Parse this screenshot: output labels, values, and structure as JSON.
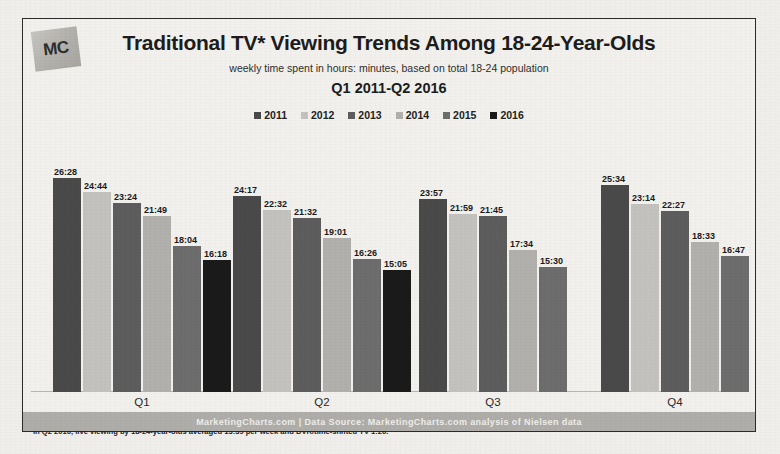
{
  "logo": {
    "text": "MC"
  },
  "header": {
    "title": "Traditional TV* Viewing Trends Among 18-24-Year-Olds",
    "subtitle": "weekly time spent in hours: minutes, based on total 18-24 population",
    "date_range": "Q1 2011-Q2 2016"
  },
  "footnotes": {
    "line1": "*Traditional TV refers to all live + DVR/time-shifted TV viewing during the quarter.",
    "line2": "In Q2 2016, live viewing by 18-24-year-olds averaged 13:39 per week and DVR/time-shifted TV 1:26."
  },
  "footer": {
    "text": "MarketingCharts.com | Data Source: MarketingCharts.com analysis of Nielsen data"
  },
  "chart_data": {
    "type": "bar",
    "title": "Traditional TV* Viewing Trends Among 18-24-Year-Olds",
    "subtitle": "weekly time spent in hours: minutes, based on total 18-24 population",
    "xlabel": "",
    "ylabel": "weekly time spent (hours:minutes)",
    "ylim": [
      0,
      28
    ],
    "grid": false,
    "legend_position": "top-center",
    "categories": [
      "Q1",
      "Q2",
      "Q3",
      "Q4"
    ],
    "series": [
      {
        "name": "2011",
        "color": "#4a4a4a",
        "labels": [
          "26:28",
          "24:17",
          "23:57",
          "25:34"
        ],
        "values": [
          26.47,
          24.28,
          23.95,
          25.57
        ]
      },
      {
        "name": "2012",
        "color": "#c5c4c0",
        "labels": [
          "24:44",
          "22:32",
          "21:59",
          "23:14"
        ],
        "values": [
          24.73,
          22.53,
          21.98,
          23.23
        ]
      },
      {
        "name": "2013",
        "color": "#5e5e5e",
        "labels": [
          "23:24",
          "21:32",
          "21:45",
          "22:27"
        ],
        "values": [
          23.4,
          21.53,
          21.75,
          22.45
        ]
      },
      {
        "name": "2014",
        "color": "#b3b2ae",
        "labels": [
          "21:49",
          "19:01",
          "17:34",
          "18:33"
        ],
        "values": [
          21.82,
          19.02,
          17.57,
          18.55
        ]
      },
      {
        "name": "2015",
        "color": "#6e6e6e",
        "labels": [
          "18:04",
          "16:26",
          "15:30",
          "16:47"
        ],
        "values": [
          18.07,
          16.43,
          15.5,
          16.78
        ]
      },
      {
        "name": "2016",
        "color": "#1a1a1a",
        "labels": [
          "16:18",
          "15:05",
          null,
          null
        ],
        "values": [
          16.3,
          15.08,
          null,
          null
        ]
      }
    ]
  }
}
